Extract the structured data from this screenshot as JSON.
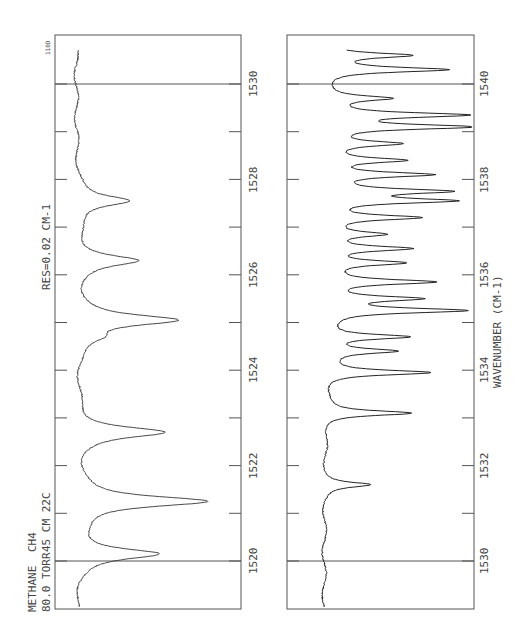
{
  "chart_data": [
    {
      "type": "line",
      "panel": "top",
      "title": "METHANE 80.0 TORR / CH4 45 CM 22C",
      "annotation": "RES=0.02 CM-1",
      "corner_label": "110D",
      "xlabel": "WAVENUMBER (CM-1)",
      "ylabel": "Transmittance",
      "xlim": [
        1519.5,
        1531.5
      ],
      "x_ticks": [
        1520,
        1521,
        1522,
        1523,
        1524,
        1525,
        1526,
        1527,
        1528,
        1529,
        1530
      ],
      "x_tick_labels": [
        "1520",
        "1522",
        "1524",
        "1526",
        "1528",
        "1530"
      ],
      "grid": false,
      "absorption_peaks": [
        {
          "x": 1520.15,
          "depth": 0.55
        },
        {
          "x": 1521.25,
          "depth": 0.88
        },
        {
          "x": 1522.7,
          "depth": 0.58
        },
        {
          "x": 1524.7,
          "depth": 0.12
        },
        {
          "x": 1525.05,
          "depth": 0.66
        },
        {
          "x": 1526.3,
          "depth": 0.4
        },
        {
          "x": 1527.55,
          "depth": 0.36
        }
      ]
    },
    {
      "type": "line",
      "panel": "bottom",
      "xlabel": "WAVENUMBER (CM-1)",
      "ylabel": "Transmittance",
      "xlim": [
        1529.5,
        1541.5
      ],
      "x_ticks": [
        1530,
        1531,
        1532,
        1533,
        1534,
        1535,
        1536,
        1537,
        1538,
        1539,
        1540
      ],
      "x_tick_labels": [
        "1530",
        "1532",
        "1534",
        "1536",
        "1538",
        "1540"
      ],
      "grid": false,
      "absorption_peaks": [
        {
          "x": 1531.6,
          "depth": 0.3
        },
        {
          "x": 1533.1,
          "depth": 0.58
        },
        {
          "x": 1533.95,
          "depth": 0.7
        },
        {
          "x": 1534.4,
          "depth": 0.45
        },
        {
          "x": 1534.7,
          "depth": 0.55
        },
        {
          "x": 1535.25,
          "depth": 0.9
        },
        {
          "x": 1535.5,
          "depth": 0.6
        },
        {
          "x": 1535.85,
          "depth": 0.7
        },
        {
          "x": 1536.25,
          "depth": 0.5
        },
        {
          "x": 1536.55,
          "depth": 0.55
        },
        {
          "x": 1536.85,
          "depth": 0.35
        },
        {
          "x": 1537.2,
          "depth": 0.6
        },
        {
          "x": 1537.55,
          "depth": 0.8
        },
        {
          "x": 1537.75,
          "depth": 0.75
        },
        {
          "x": 1538.1,
          "depth": 0.68
        },
        {
          "x": 1538.4,
          "depth": 0.5
        },
        {
          "x": 1538.75,
          "depth": 0.45
        },
        {
          "x": 1539.1,
          "depth": 0.95
        },
        {
          "x": 1539.35,
          "depth": 0.9
        },
        {
          "x": 1539.7,
          "depth": 0.4
        },
        {
          "x": 1540.3,
          "depth": 0.8
        },
        {
          "x": 1540.6,
          "depth": 0.55
        }
      ]
    }
  ],
  "labels": {
    "sample_line1": "METHANE",
    "sample_line2": "80.0 TORR",
    "gas_line1": "CH4",
    "gas_line2": "45 CM 22C",
    "resolution": "RES=0.02 CM-1",
    "corner": "110D",
    "axis_title": "WAVENUMBER (CM-1)",
    "top_ticks": [
      "1520",
      "1522",
      "1524",
      "1526",
      "1528",
      "1530"
    ],
    "bottom_ticks": [
      "1530",
      "1532",
      "1534",
      "1536",
      "1538",
      "1540"
    ]
  }
}
